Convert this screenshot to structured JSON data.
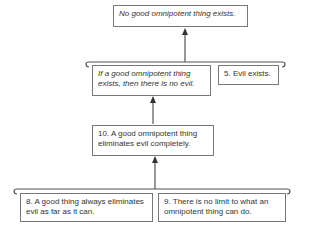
{
  "diagram": {
    "conclusion": "No good omnipotent thing exists.",
    "intermediate": "If a good omnipotent thing exists, then there is no evil.",
    "premise5": "5. Evil exists.",
    "premise10": "10. A good omnipotent thing eliminates evil completely.",
    "premise8": "8. A good thing always eliminates evil as far as it can.",
    "premise9": "9. There is no limit to what an omnipotent thing can do."
  },
  "colors": {
    "line": "#555555",
    "border": "#777777",
    "text": "#333333"
  }
}
